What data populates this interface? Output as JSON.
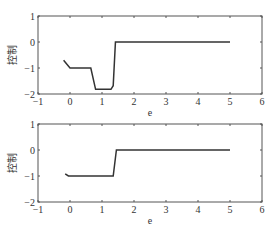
{
  "chart_data": [
    {
      "type": "line",
      "title": "",
      "xlabel": "e",
      "ylabel": "控制",
      "xlim": [
        -1,
        6
      ],
      "ylim": [
        -2,
        1
      ],
      "xticks": [
        "-1",
        "0",
        "1",
        "2",
        "3",
        "4",
        "5",
        "6"
      ],
      "yticks": [
        "1",
        "0",
        "-1",
        "-2"
      ],
      "grid": false,
      "series": [
        {
          "name": "control",
          "color": "#333333",
          "x": [
            -0.2,
            0.0,
            0.65,
            0.8,
            1.28,
            1.35,
            1.42,
            5.0
          ],
          "y": [
            -0.7,
            -1.0,
            -1.0,
            -1.82,
            -1.82,
            -1.68,
            0.0,
            0.0
          ]
        }
      ]
    },
    {
      "type": "line",
      "title": "",
      "xlabel": "e",
      "ylabel": "控制",
      "xlim": [
        -1,
        6
      ],
      "ylim": [
        -2,
        1
      ],
      "xticks": [
        "-1",
        "0",
        "1",
        "2",
        "3",
        "4",
        "5",
        "6"
      ],
      "yticks": [
        "1",
        "0",
        "-1",
        "-2"
      ],
      "grid": false,
      "series": [
        {
          "name": "control",
          "color": "#333333",
          "x": [
            -0.15,
            -0.05,
            1.35,
            1.45,
            5.0
          ],
          "y": [
            -0.92,
            -1.0,
            -1.0,
            0.0,
            0.0
          ]
        }
      ]
    }
  ]
}
